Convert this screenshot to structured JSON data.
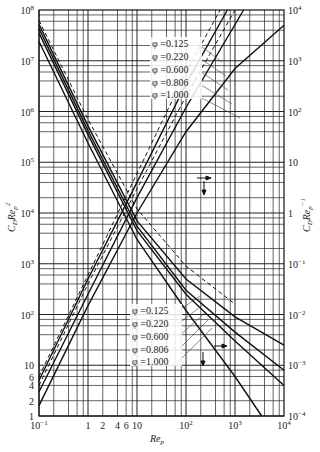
{
  "chart_data": {
    "type": "line",
    "title": "",
    "xscale": "log",
    "xlabel": "Re_p",
    "ylabel_left": "C_D Re_p^2",
    "ylabel_right": "C_D Re_p^-1",
    "xlim": [
      0.1,
      10000
    ],
    "ylim_left": [
      1,
      100000000
    ],
    "ylim_right": [
      0.0001,
      10000
    ],
    "grid": true,
    "x_ticks": [
      "10^-1",
      "1",
      "2",
      "4",
      "6",
      "10",
      "10^2",
      "10^3",
      "10^4"
    ],
    "y_ticks_left": [
      "1",
      "2",
      "4",
      "6",
      "10",
      "10^2",
      "10^3",
      "10^4",
      "10^5",
      "10^6",
      "10^7",
      "10^8"
    ],
    "y_ticks_right": [
      "10^-4",
      "10^-3",
      "10^-2",
      "10^-1",
      "1",
      "10",
      "10^2",
      "10^3",
      "10^4"
    ],
    "legend_upper": {
      "title": "C_D Re_p^-1 curves (read on right axis, arrow →↓)",
      "entries": [
        "φ=0.125",
        "φ=0.220",
        "φ=0.600",
        "φ=0.806",
        "φ=1.000"
      ]
    },
    "legend_lower": {
      "title": "C_D Re_p^2 curves (read on left axis)",
      "entries": [
        "φ=0.125",
        "φ=0.220",
        "φ=0.600",
        "φ=0.806",
        "φ=1.000"
      ]
    },
    "series": [
      {
        "name": "C_D Re_p^2, φ=0.125",
        "axis": "left",
        "style": "dashed",
        "x": [
          0.1,
          1,
          10,
          100,
          1000
        ],
        "y": [
          62000000,
          700000,
          12000,
          900,
          160
        ]
      },
      {
        "name": "C_D Re_p^2, φ=0.220",
        "axis": "left",
        "style": "solid",
        "x": [
          0.1,
          1,
          10,
          100,
          1000,
          10000
        ],
        "y": [
          52000000,
          520000,
          7000,
          500,
          90,
          25
        ]
      },
      {
        "name": "C_D Re_p^2, φ=0.600",
        "axis": "left",
        "style": "solid",
        "x": [
          0.1,
          1,
          10,
          100,
          1000,
          10000
        ],
        "y": [
          43000000,
          420000,
          5500,
          300,
          45,
          8
        ]
      },
      {
        "name": "C_D Re_p^2, φ=0.806",
        "axis": "left",
        "style": "solid",
        "x": [
          0.1,
          1,
          10,
          100,
          1000,
          10000
        ],
        "y": [
          35000000,
          350000,
          4500,
          250,
          30,
          4
        ]
      },
      {
        "name": "C_D Re_p^2, φ=1.000",
        "axis": "left",
        "style": "solid",
        "x": [
          0.1,
          1,
          10,
          100,
          1000,
          3500
        ],
        "y": [
          24000000,
          240000,
          3000,
          120,
          6,
          1
        ]
      },
      {
        "name": "C_D Re_p^-1, φ=0.125",
        "axis": "right",
        "style": "dashed",
        "x": [
          0.1,
          1,
          10,
          100,
          500
        ],
        "y": [
          0.0006,
          0.06,
          6,
          600,
          10000
        ]
      },
      {
        "name": "C_D Re_p^-1, φ=0.220",
        "axis": "right",
        "style": "solid",
        "x": [
          0.1,
          1,
          10,
          100,
          700
        ],
        "y": [
          0.0005,
          0.05,
          4,
          350,
          10000
        ]
      },
      {
        "name": "C_D Re_p^-1, φ=0.600",
        "axis": "right",
        "style": "dashed",
        "x": [
          0.1,
          1,
          10,
          100,
          1000
        ],
        "y": [
          0.0004,
          0.04,
          3,
          200,
          10000
        ]
      },
      {
        "name": "C_D Re_p^-1, φ=0.806",
        "axis": "right",
        "style": "solid",
        "x": [
          0.1,
          1,
          10,
          100,
          1500
        ],
        "y": [
          0.0003,
          0.025,
          2,
          120,
          10000
        ]
      },
      {
        "name": "C_D Re_p^-1, φ=1.000",
        "axis": "right",
        "style": "solid",
        "x": [
          0.1,
          1,
          10,
          100,
          1000,
          10000
        ],
        "y": [
          0.00016,
          0.015,
          1,
          40,
          700,
          5000
        ]
      }
    ]
  },
  "labels": {
    "ylabel_left_main": "C",
    "ylabel_left_sub": "D",
    "ylabel_left_re": "Re",
    "ylabel_left_resub": "p",
    "ylabel_left_sup": "2",
    "ylabel_right_main": "C",
    "ylabel_right_sub": "D",
    "ylabel_right_re": "Re",
    "ylabel_right_resub": "p",
    "ylabel_right_sup": "−1",
    "xlabel_main": "Re",
    "xlabel_sub": "p",
    "phi_upper": [
      "φ =0.125",
      "φ =0.220",
      "φ =0.600",
      "φ =0.806",
      "φ =1.000"
    ],
    "phi_lower": [
      "φ =0.125",
      "φ =0.220",
      "φ =0.600",
      "φ =0.806",
      "φ =1.000"
    ]
  }
}
